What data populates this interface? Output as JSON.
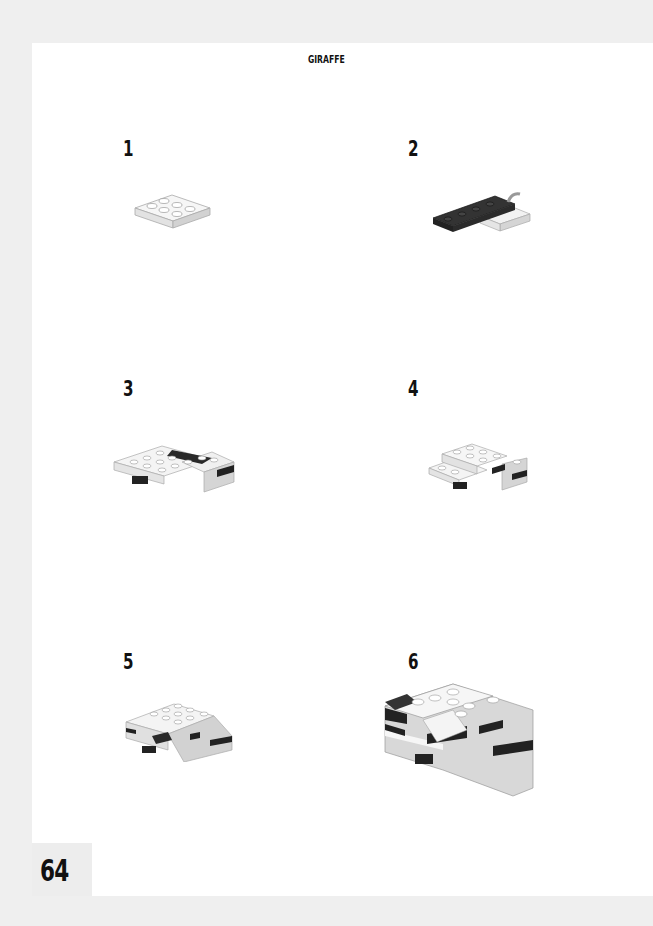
{
  "header": {
    "title": "GIRAFFE"
  },
  "page_number": "64",
  "steps": [
    {
      "number": "1",
      "illustration": "white 2x3 brick plate"
    },
    {
      "number": "2",
      "illustration": "black 1x6 plate with white clip plate"
    },
    {
      "number": "3",
      "illustration": "white plates with black accents assembly"
    },
    {
      "number": "4",
      "illustration": "stacked white plates with black accents"
    },
    {
      "number": "5",
      "illustration": "body assembly with black and grey pieces"
    },
    {
      "number": "6",
      "illustration": "completed giraffe body section"
    }
  ],
  "colors": {
    "brick_white": "#f4f4f4",
    "brick_grey": "#cfcfcf",
    "brick_black": "#2a2a2a",
    "page": "#ffffff",
    "border": "#efefef"
  }
}
